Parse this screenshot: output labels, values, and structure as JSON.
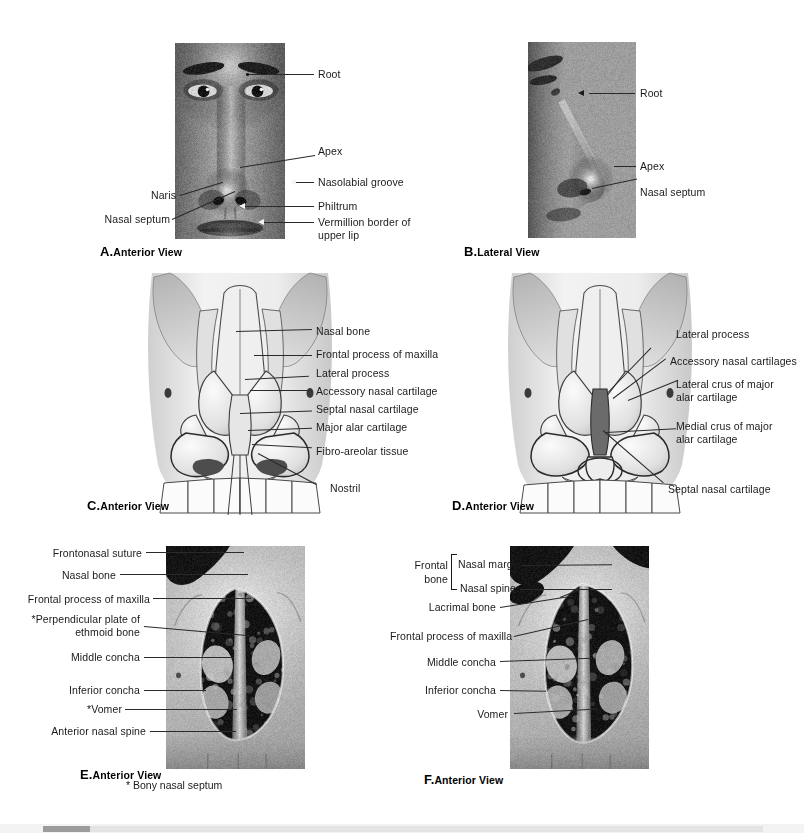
{
  "document": {
    "type": "anatomy-atlas-plate",
    "subject": "External nose and bony nasal aperture",
    "footnote": "* Bony nasal septum"
  },
  "panels": [
    {
      "id": "A",
      "letter": "A.",
      "caption": "Anterior View",
      "media": "photograph",
      "subject": "anterior view of face showing external nose",
      "labels": [
        {
          "text": "Root"
        },
        {
          "text": "Apex"
        },
        {
          "text": "Nasolabial groove"
        },
        {
          "text": "Philtrum"
        },
        {
          "text": "Vermillion border of\nupper lip"
        },
        {
          "text": "Naris"
        },
        {
          "text": "Nasal septum"
        }
      ]
    },
    {
      "id": "B",
      "letter": "B.",
      "caption": "Lateral View",
      "media": "photograph",
      "subject": "lateral view of face showing external nose profile",
      "labels": [
        {
          "text": "Root"
        },
        {
          "text": "Apex"
        },
        {
          "text": "Nasal septum"
        }
      ]
    },
    {
      "id": "C",
      "letter": "C.",
      "caption": "Anterior View",
      "media": "illustration",
      "subject": "cartilages and bones of the external nose, anterior",
      "labels": [
        {
          "text": "Nasal bone"
        },
        {
          "text": "Frontal process of maxilla"
        },
        {
          "text": "Lateral process"
        },
        {
          "text": "Accessory nasal cartilage"
        },
        {
          "text": "Septal nasal cartilage"
        },
        {
          "text": "Major alar cartilage"
        },
        {
          "text": "Fibro-areolar tissue"
        },
        {
          "text": "Nostril"
        }
      ]
    },
    {
      "id": "D",
      "letter": "D.",
      "caption": "Anterior View",
      "media": "illustration",
      "subject": "major alar cartilage crura, anterior",
      "labels": [
        {
          "text": "Lateral process"
        },
        {
          "text": "Accessory nasal cartilages"
        },
        {
          "text": "Lateral crus of major\nalar cartilage"
        },
        {
          "text": "Medial crus of major\nalar cartilage"
        },
        {
          "text": "Septal nasal cartilage"
        }
      ]
    },
    {
      "id": "E",
      "letter": "E.",
      "caption": "Anterior View",
      "media": "photograph",
      "subject": "dry skull, anterior nasal aperture",
      "labels": [
        {
          "text": "Frontonasal suture"
        },
        {
          "text": "Nasal bone"
        },
        {
          "text": "Frontal process of maxilla"
        },
        {
          "text": "*Perpendicular plate of\nethmoid bone"
        },
        {
          "text": "Middle concha"
        },
        {
          "text": "Inferior concha"
        },
        {
          "text": "*Vomer"
        },
        {
          "text": "Anterior nasal spine"
        }
      ]
    },
    {
      "id": "F",
      "letter": "F.",
      "caption": "Anterior View",
      "media": "photograph",
      "subject": "dry skull, anterior nasal aperture with frontal bone",
      "group_label": "Frontal\nbone",
      "labels": [
        {
          "text": "Nasal margin"
        },
        {
          "text": "Nasal spine"
        },
        {
          "text": "Lacrimal bone"
        },
        {
          "text": "Frontal process of maxilla"
        },
        {
          "text": "Middle concha"
        },
        {
          "text": "Inferior concha"
        },
        {
          "text": "Vomer"
        }
      ]
    }
  ],
  "scrollbar": {
    "orientation": "horizontal",
    "thumb_position_px": 43,
    "thumb_width_px": 47
  },
  "colors": {
    "page_background": "#ffffff",
    "text": "#1a1a1a",
    "leader_line": "#2a2a2a",
    "scrollbar_track": "#e4e4e4",
    "scrollbar_thumb": "#9c9c9c"
  }
}
